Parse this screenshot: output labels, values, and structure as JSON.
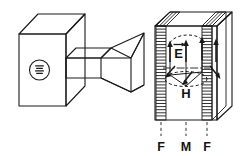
{
  "figure": {
    "type": "technical-line-drawing",
    "background_color": "#ffffff",
    "line_color": "#1a1a1a",
    "label_color": "#141414"
  },
  "components": {
    "source_box": {
      "name": "magnetron-source-box",
      "description": "rectangular cabinet drawn in isometric projection",
      "badge": {
        "shape": "circle",
        "symbol": "≋",
        "symbol_name": "magnetron-waves-symbol"
      }
    },
    "waveguide": {
      "name": "waveguide",
      "description": "rectangular duct connecting source box to horn"
    },
    "horn": {
      "name": "pyramidal-horn-antenna",
      "description": "flared pyramidal horn opening toward the sample"
    },
    "sample_block": {
      "name": "sample-block",
      "description": "rectangular slab shown in isometric projection with two hatched flange bands"
    }
  },
  "field_vectors": {
    "e_field": {
      "label": "E",
      "name": "e-field-vector-label",
      "overline": "→",
      "description": "vertical arrows, electric field direction"
    },
    "h_field": {
      "label": "H",
      "name": "h-field-vector-label",
      "overline": "→",
      "description": "horizontal loop arrows, magnetic field direction"
    }
  },
  "callouts": {
    "items": [
      {
        "label": "F",
        "name": "callout-flange-left",
        "meaning": "flange"
      },
      {
        "label": "M",
        "name": "callout-material",
        "meaning": "material sample"
      },
      {
        "label": "F",
        "name": "callout-flange-right",
        "meaning": "flange"
      }
    ]
  }
}
